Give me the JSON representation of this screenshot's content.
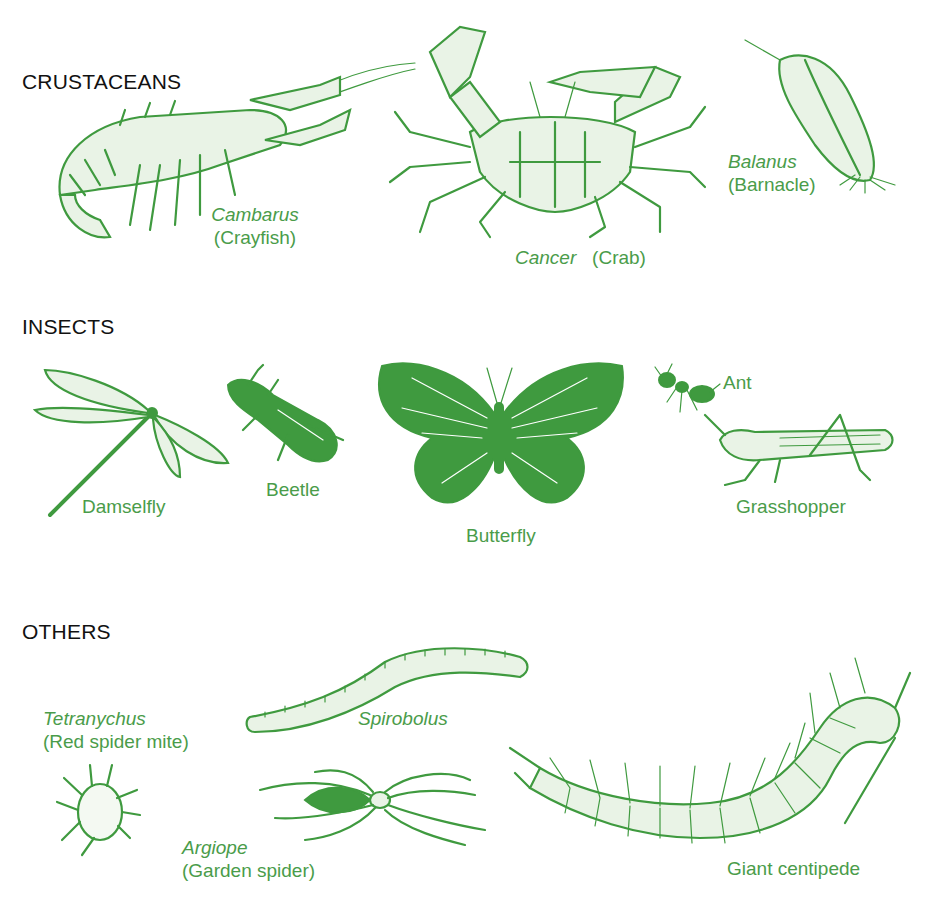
{
  "accent_color": "#4a9c4a",
  "heading_color": "#111111",
  "sections": {
    "crustaceans": {
      "heading": "CRUSTACEANS",
      "items": [
        {
          "scientific": "Cambarus",
          "common": "(Crayfish)"
        },
        {
          "scientific": "Cancer",
          "common": "(Crab)"
        },
        {
          "scientific": "Balanus",
          "common": "(Barnacle)"
        }
      ]
    },
    "insects": {
      "heading": "INSECTS",
      "items": [
        {
          "common": "Damselfly"
        },
        {
          "common": "Beetle"
        },
        {
          "common": "Butterfly"
        },
        {
          "common": "Ant"
        },
        {
          "common": "Grasshopper"
        }
      ]
    },
    "others": {
      "heading": "OTHERS",
      "items": [
        {
          "scientific": "Tetranychus",
          "common": "(Red spider mite)"
        },
        {
          "scientific": "Spirobolus"
        },
        {
          "scientific": "Argiope",
          "common": "(Garden spider)"
        },
        {
          "common": "Giant centipede"
        }
      ]
    }
  }
}
